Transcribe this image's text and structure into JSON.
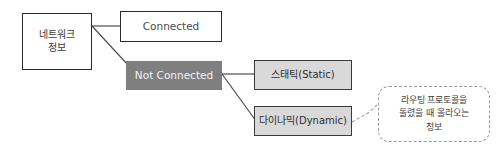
{
  "diagram": {
    "canvas": {
      "width": 498,
      "height": 154,
      "background": "#ffffff"
    },
    "colors": {
      "box_border_dark": "#2b2b2b",
      "box_fill_white": "#ffffff",
      "not_connected_fill": "#7f7f7f",
      "not_connected_text": "#f2f2f2",
      "shaded_box_fill": "#d9d9d9",
      "shaded_box_border": "#3a3a3a",
      "connector_line": "#4d4d4d",
      "callout_border": "#9a9a9a",
      "text_color": "#3d3d3d"
    },
    "nodes": {
      "network_info": {
        "label": "네트워크\n정보",
        "style": "white-box"
      },
      "connected": {
        "label": "Connected",
        "style": "white-box"
      },
      "not_connected": {
        "label": "Not Connected",
        "style": "gray-filled-box"
      },
      "static": {
        "label": "스태틱(Static)",
        "style": "shaded-box"
      },
      "dynamic": {
        "label": "다이나믹(Dynamic)",
        "style": "shaded-box"
      }
    },
    "callout": {
      "label": "라우팅 프로토콜을\n돌렸을 때 올라오는\n정보",
      "style": "dashed-rounded-bubble",
      "attached_to": "dynamic"
    },
    "connectors": [
      {
        "name": "network-info-to-connected",
        "from": "network_info",
        "to": "connected",
        "style": "solid"
      },
      {
        "name": "network-info-to-not-connected",
        "from": "network_info",
        "to": "not_connected",
        "style": "solid-diagonal"
      },
      {
        "name": "not-connected-to-static",
        "from": "not_connected",
        "to": "static",
        "style": "solid"
      },
      {
        "name": "not-connected-to-dynamic",
        "from": "not_connected",
        "to": "dynamic",
        "style": "solid-diagonal"
      },
      {
        "name": "dynamic-to-callout",
        "from": "dynamic",
        "to": "callout",
        "style": "dashed-leader"
      }
    ]
  }
}
